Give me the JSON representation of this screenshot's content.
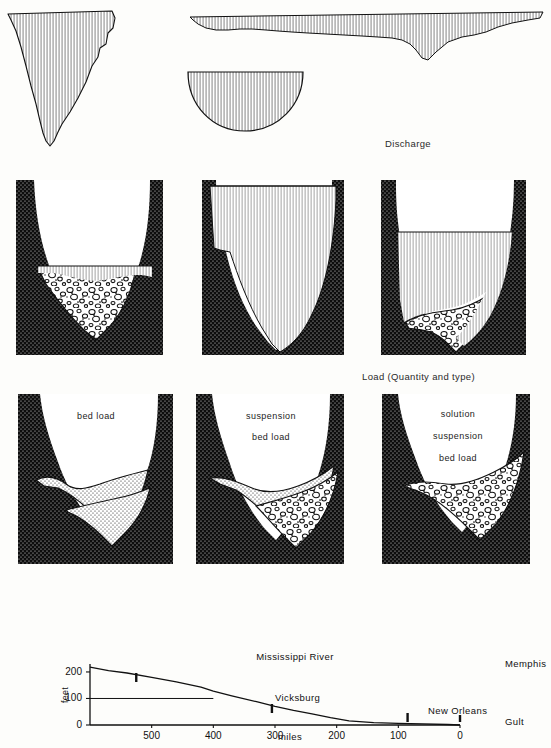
{
  "figure": {
    "title_cropped": "",
    "section_labels": [
      {
        "id": "discharge",
        "text": "Discharge",
        "x": 385,
        "y": 143
      },
      {
        "id": "load",
        "text": "Load (Quantity and type)",
        "x": 362,
        "y": 375
      }
    ]
  },
  "row_discharge": {
    "name": "discharge-hydrographs",
    "panels": [
      {
        "id": "discharge-narrow-deep",
        "shape": "narrow-deep-wedge",
        "hatch": "vertical"
      },
      {
        "id": "discharge-semicircular",
        "shape": "half-ellipse",
        "hatch": "vertical"
      },
      {
        "id": "discharge-wide-shallow",
        "shape": "wide-shallow-trough",
        "hatch": "vertical"
      }
    ]
  },
  "row_channels": {
    "name": "channel-cross-sections-load",
    "panels": [
      {
        "id": "channel-headwater",
        "water": "low",
        "deposit": "cobble",
        "label": ""
      },
      {
        "id": "channel-middle",
        "water": "full",
        "deposit": "none",
        "label": ""
      },
      {
        "id": "channel-lower",
        "water": "high",
        "deposit": "cobble",
        "label": ""
      }
    ]
  },
  "row_labeled": {
    "name": "channel-cross-sections-labeled",
    "panels": [
      {
        "id": "labeled-upper",
        "deposit": "sand-stipple",
        "labels": [
          "bed load"
        ]
      },
      {
        "id": "labeled-middle",
        "deposit": "sand-and-cobble",
        "labels": [
          "suspension",
          "bed load"
        ]
      },
      {
        "id": "labeled-lower",
        "deposit": "cobble",
        "labels": [
          "solution",
          "suspension",
          "bed load"
        ]
      }
    ]
  },
  "chart_data": {
    "type": "line",
    "title": "Mississippi River",
    "xlabel": "miles",
    "ylabel": "feet",
    "xlim": [
      600,
      0
    ],
    "ylim": [
      0,
      230
    ],
    "x_reversed": true,
    "grid": false,
    "xticks": [
      500,
      400,
      300,
      200,
      100,
      0
    ],
    "xticklabels": [
      "500",
      "400",
      "300",
      "200",
      "100",
      "0"
    ],
    "yticks": [
      0,
      100,
      200
    ],
    "yticklabels": [
      "0",
      "100",
      "200"
    ],
    "series": [
      {
        "name": "Mississippi River longitudinal profile",
        "x": [
          600,
          570,
          540,
          500,
          460,
          420,
          400,
          370,
          330,
          300,
          270,
          240,
          210,
          180,
          140,
          100,
          60,
          20,
          0
        ],
        "y": [
          218,
          205,
          196,
          180,
          163,
          143,
          128,
          110,
          88,
          70,
          55,
          42,
          28,
          16,
          9,
          6,
          4,
          2,
          0
        ]
      }
    ],
    "reference_lines": [
      {
        "id": "elevation-100ft",
        "type": "horizontal",
        "y": 100,
        "x_from": 600,
        "x_to": 400
      }
    ],
    "city_markers": [
      {
        "name": "Memphis",
        "x": 525,
        "label_x": 505,
        "label_y": 658,
        "tick_y_top": 673,
        "tick_y_bottom": 682
      },
      {
        "name": "Vicksburg",
        "x": 305,
        "label_x": 275,
        "label_y": 692,
        "tick_y_top": 704,
        "tick_y_bottom": 713
      },
      {
        "name": "New Orleans",
        "x": 85,
        "label_x": 428,
        "label_y": 705,
        "tick_y_top": 713,
        "tick_y_bottom": 722
      },
      {
        "name": "Gult",
        "x": 0,
        "label_x": 505,
        "label_y": 716,
        "tick_y_top": 715,
        "tick_y_bottom": 722
      }
    ],
    "annotations": [
      {
        "text": "Mississippi River",
        "x": 295,
        "y": 657
      }
    ]
  }
}
